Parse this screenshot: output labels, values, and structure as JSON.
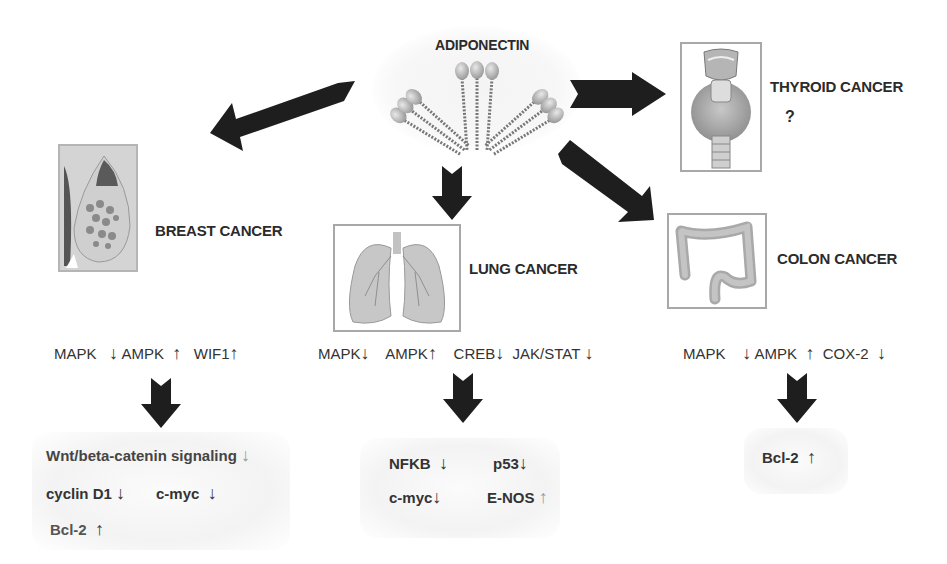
{
  "center": {
    "label": "ADIPONECTIN",
    "icon": "adiponectin-protein-icon"
  },
  "cancers": {
    "breast": {
      "label": "BREAST CANCER",
      "icon": "breast-tissue-icon",
      "signals": [
        {
          "name": "MAPK",
          "arrow": "↓"
        },
        {
          "name": "AMPK",
          "arrow": "↑"
        },
        {
          "name": "WIF1",
          "arrow": "↑"
        }
      ],
      "outcomes": [
        {
          "name": "Wnt/beta-catenin signaling",
          "arrow": "↓"
        },
        {
          "name": "cyclin D1",
          "arrow": "↓"
        },
        {
          "name": "c-myc",
          "arrow": "↓"
        },
        {
          "name": "Bcl-2",
          "arrow": "↑"
        }
      ]
    },
    "lung": {
      "label": "LUNG CANCER",
      "icon": "lungs-icon",
      "signals": [
        {
          "name": "MAPK",
          "arrow": "↓"
        },
        {
          "name": "AMPK",
          "arrow": "↑"
        },
        {
          "name": "CREB",
          "arrow": "↓"
        },
        {
          "name": "JAK/STAT",
          "arrow": "↓"
        }
      ],
      "outcomes": [
        {
          "name": "NFKB",
          "arrow": "↓"
        },
        {
          "name": "p53",
          "arrow": "↓"
        },
        {
          "name": "c-myc",
          "arrow": "↓"
        },
        {
          "name": "E-NOS",
          "arrow": "↑"
        }
      ]
    },
    "colon": {
      "label": "COLON CANCER",
      "icon": "colon-icon",
      "signals": [
        {
          "name": "MAPK",
          "arrow": "↓"
        },
        {
          "name": "AMPK",
          "arrow": "↑"
        },
        {
          "name": "COX-2",
          "arrow": "↓"
        }
      ],
      "outcomes": [
        {
          "name": "Bcl-2",
          "arrow": "↑"
        }
      ]
    },
    "thyroid": {
      "label": "THYROID CANCER",
      "icon": "thyroid-icon",
      "note": "?"
    }
  },
  "colors": {
    "arrow": "#1e1e1e",
    "text": "#2b2b2b",
    "card_border": "#a8a8a8"
  }
}
